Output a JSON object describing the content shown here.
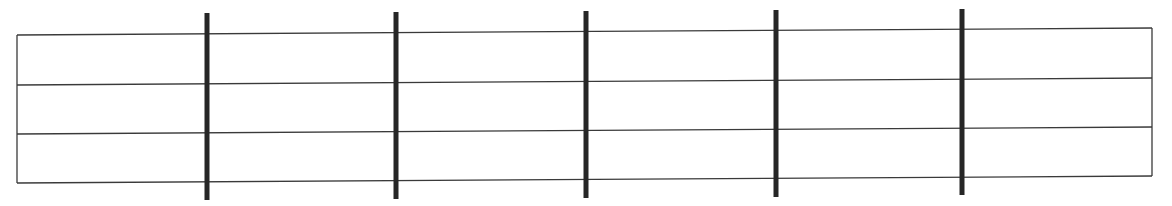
{
  "diagram": {
    "type": "blank-fretboard-grid",
    "canvas": {
      "width": 1172,
      "height": 206
    },
    "colors": {
      "background": "#ffffff",
      "line": "#3a3a3a",
      "bar": "#262626"
    },
    "frame": {
      "left_x": 17,
      "right_x": 1152,
      "left_ys": [
        35,
        85,
        134,
        183
      ],
      "right_ys": [
        28,
        78,
        127,
        176
      ]
    },
    "string_count": 4,
    "row_count": 3,
    "bars": [
      {
        "x": 207,
        "top": 13,
        "bottom": 200
      },
      {
        "x": 396,
        "top": 12,
        "bottom": 199
      },
      {
        "x": 586,
        "top": 11,
        "bottom": 198
      },
      {
        "x": 776,
        "top": 10,
        "bottom": 197
      },
      {
        "x": 962,
        "top": 9,
        "bottom": 195
      }
    ],
    "line_width": 1.3,
    "bar_width": 5
  }
}
